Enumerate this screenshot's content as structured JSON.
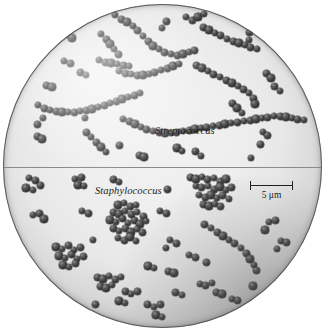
{
  "figure": {
    "kind": "light-micrograph",
    "field_shape": "circle",
    "background_color": "#ffffff",
    "field_center_color": "#efefef",
    "field_edge_color": "#6e6e6e",
    "cell_color": "#3b3b3b",
    "divider_color": "#8a8a8a"
  },
  "labels": {
    "upper": "Streptococcus",
    "lower": "Staphylococcus"
  },
  "scale_bar": {
    "text": "5 μm",
    "value": 5,
    "unit": "μm",
    "length_px": 43,
    "color": "#1f1f1f"
  },
  "chart_data": {
    "type": "scatter",
    "xlabel": "",
    "ylabel": "",
    "xlim": [
      0,
      325
    ],
    "ylim": [
      0,
      336
    ],
    "grid": false,
    "legend": "none",
    "annotations": [
      "Streptococcus",
      "Staphylococcus",
      "5 μm"
    ],
    "series": [
      {
        "name": "Streptococcus",
        "arrangement": "chains",
        "marker_size_px": 7,
        "values": [
          [
            115,
            15
          ],
          [
            121,
            19
          ],
          [
            127,
            22
          ],
          [
            133,
            26
          ],
          [
            138,
            31
          ],
          [
            143,
            36
          ],
          [
            148,
            41
          ],
          [
            153,
            46
          ],
          [
            159,
            49
          ],
          [
            165,
            52
          ],
          [
            171,
            54
          ],
          [
            177,
            55
          ],
          [
            183,
            54
          ],
          [
            189,
            52
          ],
          [
            195,
            50
          ],
          [
            101,
            34
          ],
          [
            106,
            39
          ],
          [
            110,
            44
          ],
          [
            114,
            49
          ],
          [
            118,
            54
          ],
          [
            186,
            17
          ],
          [
            192,
            20
          ],
          [
            198,
            17
          ],
          [
            204,
            14
          ],
          [
            167,
            22
          ],
          [
            162,
            28
          ],
          [
            250,
            12
          ],
          [
            252,
            19
          ],
          [
            251,
            26
          ],
          [
            250,
            33
          ],
          [
            249,
            40
          ],
          [
            203,
            27
          ],
          [
            209,
            30
          ],
          [
            215,
            33
          ],
          [
            221,
            36
          ],
          [
            227,
            39
          ],
          [
            233,
            41
          ],
          [
            239,
            43
          ],
          [
            245,
            45
          ],
          [
            251,
            47
          ],
          [
            257,
            49
          ],
          [
            67,
            34
          ],
          [
            72,
            38
          ],
          [
            64,
            61
          ],
          [
            70,
            63
          ],
          [
            99,
            60
          ],
          [
            105,
            62
          ],
          [
            111,
            63
          ],
          [
            117,
            64
          ],
          [
            123,
            65
          ],
          [
            129,
            66
          ],
          [
            196,
            65
          ],
          [
            202,
            68
          ],
          [
            208,
            71
          ],
          [
            214,
            74
          ],
          [
            220,
            77
          ],
          [
            226,
            80
          ],
          [
            232,
            83
          ],
          [
            238,
            86
          ],
          [
            244,
            89
          ],
          [
            249,
            93
          ],
          [
            253,
            98
          ],
          [
            255,
            104
          ],
          [
            119,
            71
          ],
          [
            125,
            73
          ],
          [
            131,
            74
          ],
          [
            137,
            75
          ],
          [
            143,
            75
          ],
          [
            149,
            74
          ],
          [
            155,
            72
          ],
          [
            161,
            70
          ],
          [
            167,
            68
          ],
          [
            173,
            66
          ],
          [
            179,
            64
          ],
          [
            80,
            72
          ],
          [
            86,
            75
          ],
          [
            46,
            85
          ],
          [
            52,
            87
          ],
          [
            38,
            105
          ],
          [
            44,
            108
          ],
          [
            50,
            110
          ],
          [
            56,
            111
          ],
          [
            62,
            112
          ],
          [
            68,
            112
          ],
          [
            74,
            112
          ],
          [
            80,
            111
          ],
          [
            86,
            110
          ],
          [
            92,
            109
          ],
          [
            98,
            107
          ],
          [
            104,
            105
          ],
          [
            110,
            103
          ],
          [
            116,
            101
          ],
          [
            122,
            99
          ],
          [
            128,
            97
          ],
          [
            134,
            95
          ],
          [
            140,
            93
          ],
          [
            266,
            73
          ],
          [
            271,
            78
          ],
          [
            43,
            118
          ],
          [
            38,
            124
          ],
          [
            123,
            119
          ],
          [
            129,
            121
          ],
          [
            135,
            124
          ],
          [
            141,
            127
          ],
          [
            147,
            129
          ],
          [
            153,
            131
          ],
          [
            159,
            132
          ],
          [
            165,
            133
          ],
          [
            171,
            133
          ],
          [
            177,
            132
          ],
          [
            183,
            131
          ],
          [
            189,
            130
          ],
          [
            195,
            129
          ],
          [
            201,
            128
          ],
          [
            207,
            127
          ],
          [
            213,
            126
          ],
          [
            219,
            125
          ],
          [
            225,
            124
          ],
          [
            231,
            123
          ],
          [
            86,
            132
          ],
          [
            91,
            137
          ],
          [
            96,
            142
          ],
          [
            101,
            147
          ],
          [
            106,
            152
          ],
          [
            238,
            122
          ],
          [
            244,
            121
          ],
          [
            250,
            120
          ],
          [
            256,
            119
          ],
          [
            262,
            118
          ],
          [
            268,
            117
          ],
          [
            274,
            116
          ],
          [
            280,
            116
          ],
          [
            286,
            117
          ],
          [
            292,
            118
          ],
          [
            298,
            119
          ],
          [
            304,
            120
          ],
          [
            232,
            103
          ],
          [
            237,
            108
          ],
          [
            242,
            113
          ],
          [
            275,
            86
          ],
          [
            280,
            91
          ],
          [
            37,
            136
          ],
          [
            42,
            139
          ],
          [
            263,
            132
          ],
          [
            268,
            136
          ],
          [
            85,
            118
          ],
          [
            260,
            144
          ],
          [
            177,
            148
          ],
          [
            182,
            151
          ],
          [
            196,
            152
          ],
          [
            201,
            156
          ],
          [
            139,
            155
          ],
          [
            144,
            157
          ],
          [
            251,
            158
          ],
          [
            119,
            146
          ]
        ]
      },
      {
        "name": "Staphylococcus",
        "arrangement": "clusters",
        "marker_size_px": 7,
        "values": [
          [
            29,
            178
          ],
          [
            35,
            180
          ],
          [
            26,
            188
          ],
          [
            33,
            190
          ],
          [
            40,
            186
          ],
          [
            75,
            179
          ],
          [
            81,
            177
          ],
          [
            78,
            185
          ],
          [
            84,
            186
          ],
          [
            113,
            180
          ],
          [
            119,
            182
          ],
          [
            190,
            177
          ],
          [
            196,
            179
          ],
          [
            202,
            177
          ],
          [
            208,
            180
          ],
          [
            214,
            178
          ],
          [
            220,
            181
          ],
          [
            226,
            179
          ],
          [
            196,
            186
          ],
          [
            202,
            188
          ],
          [
            208,
            186
          ],
          [
            214,
            189
          ],
          [
            220,
            187
          ],
          [
            226,
            190
          ],
          [
            232,
            188
          ],
          [
            199,
            195
          ],
          [
            205,
            197
          ],
          [
            211,
            195
          ],
          [
            217,
            198
          ],
          [
            223,
            196
          ],
          [
            229,
            199
          ],
          [
            203,
            204
          ],
          [
            209,
            206
          ],
          [
            215,
            204
          ],
          [
            221,
            207
          ],
          [
            33,
            215
          ],
          [
            39,
            213
          ],
          [
            44,
            219
          ],
          [
            82,
            211
          ],
          [
            88,
            214
          ],
          [
            160,
            211
          ],
          [
            166,
            213
          ],
          [
            118,
            205
          ],
          [
            124,
            203
          ],
          [
            130,
            207
          ],
          [
            136,
            205
          ],
          [
            113,
            212
          ],
          [
            119,
            214
          ],
          [
            125,
            211
          ],
          [
            131,
            215
          ],
          [
            137,
            212
          ],
          [
            143,
            216
          ],
          [
            110,
            220
          ],
          [
            116,
            222
          ],
          [
            122,
            219
          ],
          [
            128,
            223
          ],
          [
            134,
            220
          ],
          [
            140,
            224
          ],
          [
            146,
            221
          ],
          [
            113,
            229
          ],
          [
            119,
            231
          ],
          [
            125,
            228
          ],
          [
            131,
            232
          ],
          [
            137,
            229
          ],
          [
            143,
            233
          ],
          [
            118,
            238
          ],
          [
            124,
            240
          ],
          [
            130,
            237
          ],
          [
            136,
            241
          ],
          [
            205,
            225
          ],
          [
            211,
            228
          ],
          [
            217,
            232
          ],
          [
            223,
            236
          ],
          [
            229,
            240
          ],
          [
            235,
            244
          ],
          [
            241,
            248
          ],
          [
            246,
            253
          ],
          [
            250,
            259
          ],
          [
            254,
            265
          ],
          [
            257,
            271
          ],
          [
            170,
            240
          ],
          [
            176,
            243
          ],
          [
            56,
            247
          ],
          [
            62,
            249
          ],
          [
            68,
            246
          ],
          [
            74,
            250
          ],
          [
            80,
            247
          ],
          [
            59,
            256
          ],
          [
            65,
            258
          ],
          [
            71,
            255
          ],
          [
            77,
            259
          ],
          [
            83,
            256
          ],
          [
            63,
            265
          ],
          [
            69,
            267
          ],
          [
            75,
            264
          ],
          [
            269,
            222
          ],
          [
            275,
            220
          ],
          [
            265,
            230
          ],
          [
            281,
            241
          ],
          [
            287,
            243
          ],
          [
            277,
            249
          ],
          [
            97,
            277
          ],
          [
            103,
            279
          ],
          [
            109,
            276
          ],
          [
            115,
            280
          ],
          [
            121,
            277
          ],
          [
            100,
            286
          ],
          [
            106,
            288
          ],
          [
            112,
            285
          ],
          [
            125,
            292
          ],
          [
            131,
            294
          ],
          [
            137,
            291
          ],
          [
            119,
            301
          ],
          [
            125,
            303
          ],
          [
            148,
            305
          ],
          [
            154,
            307
          ],
          [
            160,
            304
          ],
          [
            156,
            315
          ],
          [
            162,
            317
          ],
          [
            176,
            293
          ],
          [
            182,
            295
          ],
          [
            168,
            271
          ],
          [
            174,
            273
          ],
          [
            200,
            284
          ],
          [
            206,
            286
          ],
          [
            212,
            283
          ],
          [
            216,
            292
          ],
          [
            222,
            294
          ],
          [
            232,
            299
          ],
          [
            238,
            301
          ],
          [
            189,
            255
          ],
          [
            195,
            257
          ],
          [
            148,
            266
          ],
          [
            154,
            268
          ],
          [
            95,
            305
          ],
          [
            166,
            248
          ],
          [
            206,
            262
          ],
          [
            253,
            286
          ],
          [
            93,
            240
          ],
          [
            168,
            190
          ]
        ]
      }
    ]
  }
}
